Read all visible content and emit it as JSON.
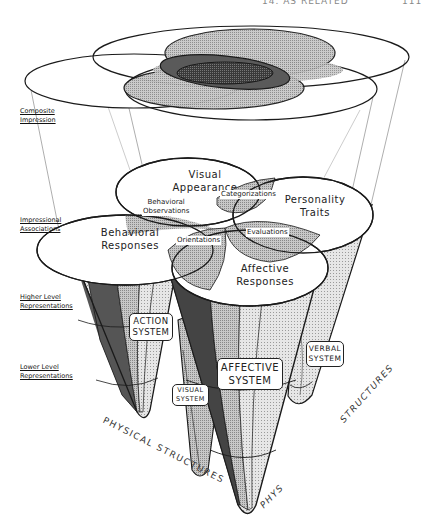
{
  "header": {
    "running_title": "14. AS RELATED",
    "page_number": "111"
  },
  "levels": [
    {
      "line1": "Composite",
      "line2": "Impression"
    },
    {
      "line1": "Impressional",
      "line2": "Associations"
    },
    {
      "line1": "Higher Level",
      "line2": "Representations"
    },
    {
      "line1": "Lower Level",
      "line2": "Representations"
    }
  ],
  "domains": {
    "visual": {
      "line1": "Visual",
      "line2": "Appearance"
    },
    "personality": {
      "line1": "Personality",
      "line2": "Traits"
    },
    "behavioral": {
      "line1": "Behavioral",
      "line2": "Responses"
    },
    "affective": {
      "line1": "Affective",
      "line2": "Responses"
    }
  },
  "overlaps": {
    "behavioral_observations": {
      "line1": "Behavioral",
      "line2": "Observations"
    },
    "categorizations": "Categorizations",
    "orientations": "Orientations",
    "evaluations": "Evaluations"
  },
  "systems": {
    "action": {
      "line1": "ACTION",
      "line2": "SYSTEM"
    },
    "visual": {
      "line1": "VISUAL",
      "line2": "SYSTEM"
    },
    "affective": {
      "line1": "AFFECTIVE",
      "line2": "SYSTEM"
    },
    "verbal": {
      "line1": "VERBAL",
      "line2": "SYSTEM"
    }
  },
  "axes": {
    "left": "PHYSICAL STRUCTURES",
    "middle": "PHYS",
    "right": "STRUCTURES"
  },
  "colors": {
    "stroke": "#1a1a1a",
    "light_fill": "#d9d9d9",
    "mid_fill": "#a8a8a8",
    "dark_fill": "#555555",
    "darkest_fill": "#333333"
  }
}
